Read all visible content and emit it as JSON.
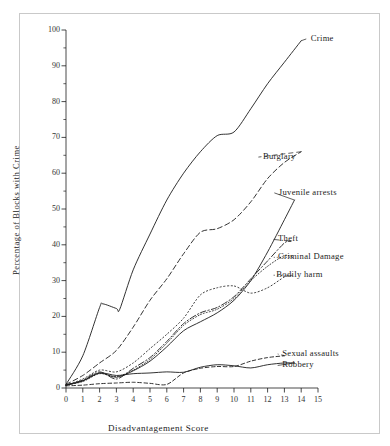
{
  "figure": {
    "frame_border_color": "#c9c9c9",
    "background": "#ffffff",
    "ink_color": "#1c1c1c"
  },
  "chart_data": {
    "type": "line",
    "title": "",
    "xlabel": "Disadvantagement Score",
    "ylabel": "Percentage of Blocks with Crime",
    "xlim": [
      0,
      15
    ],
    "ylim": [
      0,
      100
    ],
    "xticks": [
      0,
      1,
      2,
      3,
      4,
      5,
      6,
      7,
      8,
      9,
      10,
      11,
      12,
      13,
      14,
      15
    ],
    "yticks": [
      0,
      10,
      20,
      30,
      40,
      50,
      60,
      70,
      80,
      90,
      100
    ],
    "yticks_minor": [
      5,
      15,
      25,
      35,
      45,
      55,
      65,
      75,
      85,
      95
    ],
    "grid": false,
    "legend_position": "inline-right-of-line-ends",
    "series": [
      {
        "name": "Crime",
        "style": "solid",
        "label_x": 14.45,
        "label_y": 97.5,
        "x": [
          0,
          1,
          2,
          2.2,
          3,
          3.2,
          4,
          5,
          6,
          7,
          8,
          9,
          10,
          11,
          12,
          13,
          14
        ],
        "y": [
          1,
          9,
          22.5,
          23.5,
          22.2,
          22,
          33,
          43,
          52.5,
          60,
          66,
          70.5,
          71.5,
          78,
          85,
          91,
          97
        ]
      },
      {
        "name": "Burglary",
        "style": "dashed",
        "label_x": 11.6,
        "label_y": 64.5,
        "x": [
          0,
          1,
          2,
          3,
          4,
          5,
          6,
          7,
          8,
          9,
          10,
          11,
          12,
          13,
          14
        ],
        "y": [
          1,
          3.5,
          7,
          10.5,
          17,
          24.5,
          30.5,
          37.5,
          43.5,
          44.5,
          47,
          52,
          58.5,
          63,
          66
        ]
      },
      {
        "name": "Juvenile arrests",
        "style": "solid",
        "label_x": 12.55,
        "label_y": 54.5,
        "x": [
          0,
          1,
          2,
          3,
          4,
          5,
          6,
          7,
          8,
          9,
          10,
          11,
          12,
          13,
          13.6
        ],
        "y": [
          0.8,
          2,
          4.2,
          3,
          4.8,
          7.5,
          11.5,
          16,
          18.5,
          21,
          24.5,
          30,
          38,
          47,
          52.5
        ]
      },
      {
        "name": "Theft",
        "style": "dash-dot",
        "label_x": 12.5,
        "label_y": 41.5,
        "x": [
          0,
          1,
          2,
          3,
          4,
          5,
          6,
          7,
          8,
          9,
          10,
          11,
          12,
          13,
          13.4
        ],
        "y": [
          0.8,
          2.2,
          4.5,
          2.5,
          5.5,
          8.5,
          13,
          18,
          21,
          22.5,
          25.5,
          30.5,
          35.5,
          40.5,
          41
        ]
      },
      {
        "name": "Criminal Damage",
        "style": "dotted-fine",
        "label_x": 12.5,
        "label_y": 36.5,
        "x": [
          0,
          1,
          2,
          3,
          4,
          5,
          6,
          7,
          8,
          9,
          10,
          11,
          12,
          13,
          13.5
        ],
        "y": [
          0.8,
          1.8,
          4.0,
          3.2,
          5.0,
          8.0,
          12.5,
          17.5,
          20.5,
          22.0,
          25.0,
          30.0,
          34.0,
          37.0,
          36.5
        ]
      },
      {
        "name": "Bodily harm",
        "style": "dotted",
        "label_x": 12.4,
        "label_y": 31.5,
        "x": [
          0,
          1,
          2,
          3,
          4,
          5,
          6,
          7,
          8,
          9,
          10,
          11,
          12,
          13,
          13.5
        ],
        "y": [
          0.8,
          2.5,
          5.0,
          4.5,
          7.0,
          11.0,
          15.0,
          19.5,
          26.0,
          28.0,
          28.5,
          26.5,
          28.0,
          31.0,
          31.5
        ]
      },
      {
        "name": "Sexual assaults",
        "style": "dashed-fine",
        "label_x": 12.75,
        "label_y": 9.5,
        "x": [
          0,
          1,
          2,
          3,
          4,
          5,
          6,
          7,
          8,
          9,
          10,
          11,
          12,
          13
        ],
        "y": [
          0.6,
          0.8,
          1.2,
          1.4,
          1.6,
          1.3,
          1.0,
          4.2,
          5.5,
          6.0,
          6.0,
          7.5,
          8.5,
          9.0
        ]
      },
      {
        "name": "Robbery",
        "style": "solid",
        "label_x": 12.75,
        "label_y": 6.3,
        "x": [
          0,
          1,
          2,
          3,
          4,
          5,
          6,
          7,
          8,
          9,
          10,
          11,
          12,
          13,
          13.6
        ],
        "y": [
          0.8,
          2.0,
          4.2,
          3.5,
          4.0,
          4.2,
          4.5,
          4.4,
          5.8,
          6.5,
          6.2,
          5.6,
          6.5,
          7.0,
          7.0
        ]
      }
    ]
  }
}
